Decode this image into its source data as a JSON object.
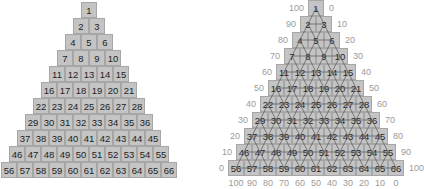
{
  "diagram": {
    "type": "triangular-number-pyramid",
    "rows": 11,
    "cells_per_row": [
      1,
      2,
      3,
      4,
      5,
      6,
      7,
      8,
      9,
      10,
      11
    ],
    "numbers": [
      [
        1
      ],
      [
        2,
        3
      ],
      [
        4,
        5,
        6
      ],
      [
        7,
        8,
        9,
        10
      ],
      [
        11,
        12,
        13,
        14,
        15
      ],
      [
        16,
        17,
        18,
        19,
        20,
        21
      ],
      [
        22,
        23,
        24,
        25,
        26,
        27,
        28
      ],
      [
        29,
        30,
        31,
        32,
        33,
        34,
        35,
        36
      ],
      [
        37,
        38,
        39,
        40,
        41,
        42,
        43,
        44,
        45
      ],
      [
        46,
        47,
        48,
        49,
        50,
        51,
        52,
        53,
        54,
        55
      ],
      [
        56,
        57,
        58,
        59,
        60,
        61,
        62,
        63,
        64,
        65,
        66
      ]
    ]
  },
  "left_pyramid": {
    "title": "Plain pyramid",
    "cell_fill": "#c4c4c4",
    "cell_border": "#a6a6a6"
  },
  "right_pyramid": {
    "title": "Pyramid with lattice and scales",
    "cell_fill": "#c4c4c4",
    "cell_border": "#a6a6a6",
    "lattice_color": "#555555",
    "left_scale": [
      "100",
      "90",
      "80",
      "70",
      "60",
      "50",
      "40",
      "30",
      "20",
      "10",
      "0"
    ],
    "right_scale": [
      "0",
      "10",
      "20",
      "30",
      "40",
      "50",
      "60",
      "70",
      "80",
      "90",
      "100"
    ],
    "bottom_scale": [
      "100",
      "90",
      "80",
      "70",
      "60",
      "50",
      "40",
      "30",
      "20",
      "10",
      "0"
    ],
    "scale_color": "#9a9a9a"
  }
}
